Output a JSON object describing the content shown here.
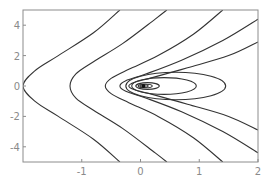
{
  "chart_data": {
    "type": "contour",
    "title": "",
    "xlabel": "",
    "ylabel": "",
    "xlim": [
      -2,
      2
    ],
    "ylim": [
      -5,
      5
    ],
    "x_ticks": [
      -1,
      0,
      1,
      2
    ],
    "x_tick_labels": [
      "-1",
      "0",
      "1",
      "2"
    ],
    "y_ticks": [
      4,
      2,
      0,
      -2,
      -4
    ],
    "y_tick_labels": [
      "4",
      "2",
      "0",
      "-2",
      "-4"
    ],
    "grid": false,
    "legend": null,
    "frame_color": "#8c8c8c",
    "line_color": "#333333",
    "singular_point": [
      0.05,
      0
    ],
    "open_contours": [
      {
        "vertex_x": -2.0,
        "upper": [
          [
            -2.0,
            0.0
          ],
          [
            -1.8,
            1.0
          ],
          [
            -1.4,
            2.0
          ],
          [
            -0.8,
            3.5
          ],
          [
            -0.35,
            5.0
          ]
        ]
      },
      {
        "vertex_x": -1.2,
        "upper": [
          [
            -1.2,
            0.0
          ],
          [
            -1.1,
            0.8
          ],
          [
            -0.8,
            1.6
          ],
          [
            -0.3,
            2.8
          ],
          [
            0.25,
            4.4
          ],
          [
            0.45,
            5.0
          ]
        ]
      },
      {
        "vertex_x": -0.6,
        "upper": [
          [
            -0.6,
            0.0
          ],
          [
            -0.5,
            0.5
          ],
          [
            -0.2,
            1.1
          ],
          [
            0.3,
            2.0
          ],
          [
            0.9,
            3.4
          ],
          [
            1.4,
            5.0
          ]
        ]
      },
      {
        "vertex_x": -0.35,
        "upper": [
          [
            -0.35,
            0.0
          ],
          [
            -0.25,
            0.35
          ],
          [
            0.1,
            0.8
          ],
          [
            0.7,
            1.7
          ],
          [
            1.4,
            3.0
          ],
          [
            2.0,
            4.4
          ]
        ]
      },
      {
        "vertex_x": -0.2,
        "upper": [
          [
            -0.2,
            0.0
          ],
          [
            -0.1,
            0.25
          ],
          [
            0.2,
            0.55
          ],
          [
            0.8,
            1.2
          ],
          [
            1.5,
            2.0
          ],
          [
            2.0,
            2.9
          ]
        ]
      }
    ],
    "closed_contours": [
      {
        "center": [
          0.4,
          0.0
        ],
        "rx": 0.55,
        "ry": 0.55
      },
      {
        "center": [
          0.6,
          0.0
        ],
        "rx": 0.85,
        "ry": 0.9
      },
      {
        "center": [
          0.12,
          0.0
        ],
        "rx": 0.2,
        "ry": 0.22
      },
      {
        "center": [
          0.08,
          0.0
        ],
        "rx": 0.12,
        "ry": 0.12
      },
      {
        "center": [
          0.06,
          0.0
        ],
        "rx": 0.07,
        "ry": 0.08
      }
    ]
  }
}
